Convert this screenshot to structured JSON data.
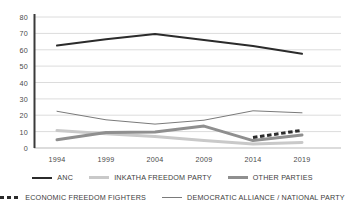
{
  "chart_data": {
    "type": "line",
    "title": "",
    "subtitle": "",
    "xlabel": "",
    "ylabel": "",
    "x": [
      "1994",
      "1999",
      "2004",
      "2009",
      "2014",
      "2019"
    ],
    "categories": [
      "1994",
      "1999",
      "2004",
      "2009",
      "2014",
      "2019"
    ],
    "ylim": [
      0,
      80
    ],
    "yticks": [
      "0",
      "10",
      "20",
      "30",
      "40",
      "50",
      "60",
      "70",
      "80"
    ],
    "ytick_values": [
      0,
      10,
      20,
      30,
      40,
      50,
      60,
      70,
      80
    ],
    "grid": "horizontal",
    "legend_position": "bottom",
    "series": [
      {
        "name": "ANC",
        "color": "#2b2b2b",
        "width": 2,
        "style": "solid",
        "values": [
          62.6,
          66.4,
          69.7,
          65.9,
          62.2,
          57.5
        ]
      },
      {
        "name": "DEMOCRATIC ALLIANCE / NATIONAL PARTY",
        "color": "#7a7a7a",
        "width": 1,
        "style": "solid",
        "values": [
          22.4,
          17.2,
          14.6,
          17.0,
          22.7,
          21.5
        ]
      },
      {
        "name": "INKATHA FREEDOM PARTY",
        "color": "#c9c9c9",
        "width": 3,
        "style": "solid",
        "values": [
          10.6,
          8.7,
          7.0,
          4.6,
          2.4,
          3.4
        ]
      },
      {
        "name": "OTHER PARTIES",
        "color": "#8f8f8f",
        "width": 3,
        "style": "solid",
        "values": [
          5.0,
          9.4,
          9.7,
          13.4,
          4.5,
          8.0
        ]
      },
      {
        "name": "ECONOMIC FREEDOM FIGHTERS",
        "color": "#2b2b2b",
        "width": 3,
        "style": "dashed",
        "values": [
          null,
          null,
          null,
          null,
          6.4,
          10.8
        ]
      }
    ]
  },
  "axes": {
    "y_ticks": [
      "80",
      "70",
      "60",
      "50",
      "40",
      "30",
      "20",
      "10",
      "0"
    ],
    "x_ticks": [
      "1994",
      "1999",
      "2004",
      "2009",
      "2014",
      "2019"
    ]
  },
  "legend": {
    "row1": [
      {
        "label": "ANC",
        "swatch": "sw-anc",
        "icon": "line-swatch-solid-dark"
      },
      {
        "label": "INKATHA FREEDOM PARTY",
        "swatch": "sw-ifp",
        "icon": "line-swatch-solid-light"
      },
      {
        "label": "OTHER PARTIES",
        "swatch": "sw-other",
        "icon": "line-swatch-solid-gray"
      }
    ],
    "row2": [
      {
        "label": "ECONOMIC FREEDOM FIGHTERS",
        "swatch": "sw-eff",
        "icon": "line-swatch-dashed-dark"
      },
      {
        "label": "DEMOCRATIC ALLIANCE / NATIONAL PARTY",
        "swatch": "sw-da",
        "icon": "line-swatch-thin-gray"
      }
    ]
  },
  "colors": {
    "anc": "#2b2b2b",
    "ifp": "#c9c9c9",
    "other": "#8f8f8f",
    "da": "#7a7a7a",
    "eff": "#2b2b2b",
    "grid": "#dcdcdc",
    "axis": "#3a3a3a",
    "background": "#ffffff"
  }
}
